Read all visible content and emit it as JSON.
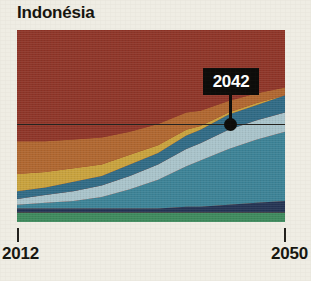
{
  "title": "Indonésia",
  "background_color": "#efede4",
  "callout": {
    "label": "2042",
    "box_color": "#0d0c0a",
    "text_color": "#ffffff"
  },
  "axis": {
    "start_label": "2012",
    "end_label": "2050"
  },
  "chart_data": {
    "type": "area",
    "title": "Indonésia",
    "xlabel": "",
    "ylabel": "",
    "xlim": [
      2012,
      2050
    ],
    "ylim": [
      0,
      100
    ],
    "grid": false,
    "legend": "none",
    "stacked": true,
    "x": [
      2012,
      2016,
      2020,
      2024,
      2028,
      2032,
      2036,
      2038,
      2042,
      2046,
      2050
    ],
    "annotations": [
      {
        "label": "2042",
        "x": 2042,
        "y": 50,
        "style": "black-box-callout-with-dot"
      }
    ],
    "reference_line": {
      "y": 50,
      "color": "#22201c",
      "orientation": "horizontal"
    },
    "series": [
      {
        "name": "green-band",
        "color": "#3d8a5d",
        "values": [
          5,
          5,
          5,
          5,
          5,
          5,
          5,
          5,
          5,
          5,
          5
        ]
      },
      {
        "name": "dark-navy-band",
        "color": "#233353",
        "values": [
          2,
          2,
          2,
          2,
          2,
          2,
          3,
          3,
          4,
          5,
          6
        ]
      },
      {
        "name": "teal-band",
        "color": "#3b8296",
        "values": [
          2,
          3,
          4,
          6,
          10,
          15,
          21,
          24,
          29,
          33,
          36
        ]
      },
      {
        "name": "light-blue-band",
        "color": "#a9c4cb",
        "values": [
          3,
          4,
          5,
          6,
          7,
          8,
          9,
          9,
          10,
          10,
          10
        ]
      },
      {
        "name": "steel-blue-band",
        "color": "#2f6a85",
        "values": [
          4,
          4,
          5,
          5,
          6,
          6,
          7,
          7,
          8,
          8,
          9
        ]
      },
      {
        "name": "gold-band",
        "color": "#c9a23c",
        "values": [
          9,
          8,
          7,
          6,
          5,
          4,
          3,
          2,
          1,
          1,
          0
        ]
      },
      {
        "name": "orange-brown-band",
        "color": "#b0662f",
        "values": [
          17,
          16,
          15,
          14,
          12,
          11,
          9,
          8,
          6,
          5,
          4
        ]
      },
      {
        "name": "brick-red-band",
        "color": "#8e3427",
        "values": [
          58,
          58,
          57,
          56,
          53,
          49,
          43,
          42,
          37,
          33,
          30
        ]
      }
    ]
  }
}
